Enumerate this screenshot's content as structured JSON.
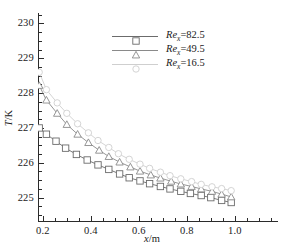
{
  "chart_data": {
    "type": "line",
    "title": "",
    "xlabel": "x/m",
    "ylabel": "T/K",
    "xlim": [
      0.18,
      1.18
    ],
    "ylim": [
      224.3,
      230.3
    ],
    "xticks": [
      "0.2",
      "0.4",
      "0.6",
      "0.8",
      "1.0"
    ],
    "xtick_values": [
      0.2,
      0.4,
      0.6,
      0.8,
      1.0
    ],
    "yticks": [
      "225",
      "226",
      "227",
      "228",
      "229",
      "230"
    ],
    "ytick_values": [
      225,
      226,
      227,
      228,
      229,
      230
    ],
    "xminor_step": 0.05,
    "yminor_step": 0.25,
    "grid": false,
    "legend_position": "upper-center-right",
    "series": [
      {
        "name": "Re_x=82.5",
        "label_prefix": "Re",
        "label_sub": "x",
        "label_value": "=82.5",
        "marker": "square",
        "color": "#6b6b6b",
        "x": [
          0.185,
          0.215,
          0.255,
          0.295,
          0.34,
          0.385,
          0.43,
          0.475,
          0.52,
          0.56,
          0.605,
          0.645,
          0.69,
          0.73,
          0.775,
          0.815,
          0.86,
          0.9,
          0.945,
          0.985
        ],
        "y": [
          227.0,
          226.82,
          226.62,
          226.42,
          226.24,
          226.08,
          225.94,
          225.81,
          225.68,
          225.57,
          225.48,
          225.4,
          225.32,
          225.25,
          225.18,
          225.12,
          225.06,
          225.0,
          224.92,
          224.86
        ]
      },
      {
        "name": "Re_x=49.5",
        "label_prefix": "Re",
        "label_sub": "x",
        "label_value": "=49.5",
        "marker": "triangle",
        "color": "#8a8a8a",
        "x": [
          0.185,
          0.215,
          0.26,
          0.3,
          0.345,
          0.39,
          0.435,
          0.475,
          0.52,
          0.565,
          0.605,
          0.65,
          0.69,
          0.735,
          0.775,
          0.82,
          0.86,
          0.905,
          0.945,
          0.985
        ],
        "y": [
          228.22,
          227.8,
          227.42,
          227.1,
          226.82,
          226.58,
          226.36,
          226.18,
          226.02,
          225.88,
          225.76,
          225.65,
          225.56,
          225.47,
          225.39,
          225.32,
          225.25,
          225.18,
          225.1,
          225.02
        ]
      },
      {
        "name": "Re_x=16.5",
        "label_prefix": "Re",
        "label_sub": "x",
        "label_value": "=16.5",
        "marker": "circle",
        "color": "#cfcfcf",
        "x": [
          0.185,
          0.215,
          0.26,
          0.3,
          0.345,
          0.39,
          0.43,
          0.475,
          0.515,
          0.56,
          0.605,
          0.645,
          0.69,
          0.73,
          0.775,
          0.82,
          0.86,
          0.905,
          0.945,
          0.985
        ],
        "y": [
          228.6,
          228.1,
          227.72,
          227.42,
          227.12,
          226.86,
          226.64,
          226.44,
          226.26,
          226.1,
          225.96,
          225.84,
          225.73,
          225.63,
          225.54,
          225.46,
          225.38,
          225.31,
          225.26,
          225.2
        ]
      }
    ]
  }
}
